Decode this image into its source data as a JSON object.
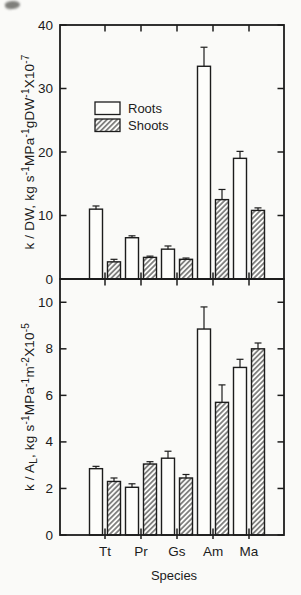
{
  "figure": {
    "colors": {
      "background": "#fafaf8",
      "axis": "#1c1c1c",
      "text": "#1c1c1c",
      "bar_fill": "#fdfdfb",
      "bar_stroke": "#1c1c1c"
    },
    "x_axis": {
      "label": "Species",
      "categories": [
        "Tt",
        "Pr",
        "Gs",
        "Am",
        "Ma"
      ]
    },
    "legend": {
      "items": [
        {
          "label": "Roots",
          "swatch": "open"
        },
        {
          "label": "Shoots",
          "swatch": "hatched"
        }
      ]
    }
  },
  "chart_data": [
    {
      "type": "bar",
      "panel": "top",
      "ylabel": "k / DW, kg s-1MPa-1gDW-1X10-7",
      "ylabel_segments": [
        [
          "k / DW, kg s",
          "n"
        ],
        [
          "-1",
          "sup"
        ],
        [
          "MPa",
          "n"
        ],
        [
          "-1",
          "sup"
        ],
        [
          "gDW",
          "n"
        ],
        [
          "-1",
          "sup"
        ],
        [
          "X10",
          "n"
        ],
        [
          "-7",
          "sup"
        ]
      ],
      "ylim": [
        0,
        40
      ],
      "yticks": [
        0,
        10,
        20,
        30,
        40
      ],
      "grid": false,
      "categories": [
        "Tt",
        "Pr",
        "Gs",
        "Am",
        "Ma"
      ],
      "series": [
        {
          "name": "Roots",
          "values": [
            11.0,
            6.5,
            4.7,
            33.5,
            19.0
          ],
          "errors": [
            0.5,
            0.3,
            0.5,
            3.0,
            1.1
          ]
        },
        {
          "name": "Shoots",
          "values": [
            2.7,
            3.4,
            3.1,
            12.5,
            10.8
          ],
          "errors": [
            0.4,
            0.2,
            0.2,
            1.6,
            0.4
          ]
        }
      ]
    },
    {
      "type": "bar",
      "panel": "bottom",
      "ylabel": "k / AL, kg s-1MPa-1m-2X10-5",
      "ylabel_segments": [
        [
          "k / A",
          "n"
        ],
        [
          "L",
          "sub"
        ],
        [
          ", kg s",
          "n"
        ],
        [
          "-1",
          "sup"
        ],
        [
          "MPa",
          "n"
        ],
        [
          "-1",
          "sup"
        ],
        [
          "m",
          "n"
        ],
        [
          "-2",
          "sup"
        ],
        [
          "X10",
          "n"
        ],
        [
          "-5",
          "sup"
        ]
      ],
      "ylim": [
        0,
        10
      ],
      "yticks": [
        0,
        2,
        4,
        6,
        8,
        10
      ],
      "grid": false,
      "categories": [
        "Tt",
        "Pr",
        "Gs",
        "Am",
        "Ma"
      ],
      "series": [
        {
          "name": "Roots",
          "values": [
            2.85,
            2.05,
            3.3,
            8.85,
            7.2
          ],
          "errors": [
            0.1,
            0.15,
            0.3,
            0.95,
            0.35
          ]
        },
        {
          "name": "Shoots",
          "values": [
            2.3,
            3.05,
            2.45,
            5.7,
            8.0
          ],
          "errors": [
            0.15,
            0.1,
            0.15,
            0.75,
            0.25
          ]
        }
      ]
    }
  ]
}
